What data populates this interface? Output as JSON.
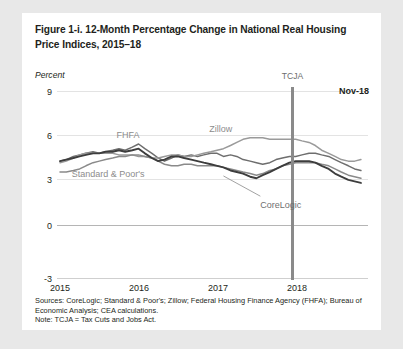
{
  "figure": {
    "title": "Figure 1-i. 12-Month Percentage Change in National Real Housing Price Indices, 2015–18",
    "y_axis_unit": "Percent",
    "nov_label": "Nov-18",
    "tcja_label": "TCJA",
    "sources": "Sources: CoreLogic; Standard & Poor's; Zillow; Federal Housing Finance Agency (FHFA); Bureau of Economic Analysis; CEA calculations.",
    "note": "Note: TCJA = Tax Cuts and Jobs Act."
  },
  "colors": {
    "corelogic": "#3d3d3d",
    "fhfa": "#6e6e6e",
    "zillow": "#9a9a9a",
    "standard_poors": "#8a8a8a",
    "tcja_marker": "#8a8a8a",
    "gridline": "#e3e3e3",
    "zeroline": "#b5b5b5",
    "card_background": "#ffffff",
    "page_background": "#e8e8e8",
    "text": "#231f20"
  },
  "chart_data": {
    "type": "line",
    "title": "Figure 1-i. 12-Month Percentage Change in National Real Housing Price Indices, 2015–18",
    "xlabel": "",
    "ylabel": "Percent",
    "ylim": [
      -3,
      9
    ],
    "yticks": [
      9,
      6,
      3,
      0,
      -3
    ],
    "ytick_labels": [
      "9",
      "6",
      "3",
      "0",
      "-3"
    ],
    "xlim": [
      2015.0,
      2018.92
    ],
    "xticks": [
      2015,
      2016,
      2017,
      2018
    ],
    "xtick_labels": [
      "2015",
      "2016",
      "2017",
      "2018"
    ],
    "grid": true,
    "legend": "inline-labels",
    "annotations": [
      {
        "name": "tcja",
        "text": "TCJA",
        "x": 2017.96,
        "type": "vertical-line"
      },
      {
        "name": "last-observation",
        "text": "Nov-18",
        "x": 2018.87,
        "y": 8.3,
        "type": "text"
      },
      {
        "name": "corelogic-leader",
        "text": "CoreLogic",
        "x": 2017.55,
        "y": 2.0,
        "type": "leader-line"
      }
    ],
    "series": [
      {
        "name": "FHFA",
        "color": "#6e6e6e",
        "label_x": 2015.72,
        "label_y": 6.1,
        "x": [
          2015.0,
          2015.08,
          2015.17,
          2015.25,
          2015.33,
          2015.42,
          2015.5,
          2015.58,
          2015.67,
          2015.75,
          2015.83,
          2015.92,
          2016.0,
          2016.08,
          2016.17,
          2016.25,
          2016.33,
          2016.42,
          2016.5,
          2016.58,
          2016.67,
          2016.75,
          2016.83,
          2016.92,
          2017.0,
          2017.08,
          2017.17,
          2017.25,
          2017.33,
          2017.42,
          2017.5,
          2017.58,
          2017.67,
          2017.75,
          2017.83,
          2017.92,
          2018.0,
          2018.08,
          2018.17,
          2018.25,
          2018.33,
          2018.42,
          2018.5,
          2018.58,
          2018.67,
          2018.75,
          2018.83
        ],
        "values": [
          4.5,
          4.6,
          4.8,
          4.9,
          5.0,
          5.1,
          5.0,
          5.1,
          5.2,
          5.3,
          5.2,
          5.4,
          5.6,
          5.3,
          5.0,
          4.7,
          4.5,
          4.7,
          4.9,
          4.8,
          4.9,
          4.8,
          4.9,
          5.0,
          5.0,
          4.8,
          4.9,
          4.8,
          4.6,
          4.5,
          4.4,
          4.3,
          4.4,
          4.6,
          4.7,
          4.8,
          4.8,
          4.9,
          5.0,
          5.0,
          4.9,
          4.8,
          4.6,
          4.4,
          4.2,
          4.0,
          3.9
        ]
      },
      {
        "name": "Zillow",
        "color": "#9a9a9a",
        "label_x": 2016.9,
        "label_y": 6.5,
        "x": [
          2015.0,
          2015.08,
          2015.17,
          2015.25,
          2015.33,
          2015.42,
          2015.5,
          2015.58,
          2015.67,
          2015.75,
          2015.83,
          2015.92,
          2016.0,
          2016.08,
          2016.17,
          2016.25,
          2016.33,
          2016.42,
          2016.5,
          2016.58,
          2016.67,
          2016.75,
          2016.83,
          2016.92,
          2017.0,
          2017.08,
          2017.17,
          2017.25,
          2017.33,
          2017.42,
          2017.5,
          2017.58,
          2017.67,
          2017.75,
          2017.83,
          2017.92,
          2018.0,
          2018.08,
          2018.17,
          2018.25,
          2018.33,
          2018.42,
          2018.5,
          2018.58,
          2018.67,
          2018.75,
          2018.83
        ],
        "values": [
          4.4,
          4.5,
          4.7,
          4.9,
          5.0,
          5.0,
          5.0,
          5.0,
          5.0,
          4.9,
          4.9,
          4.9,
          4.8,
          4.8,
          4.7,
          4.7,
          4.8,
          4.9,
          4.9,
          4.8,
          4.8,
          4.9,
          5.0,
          5.1,
          5.2,
          5.3,
          5.5,
          5.7,
          5.9,
          6.0,
          6.0,
          6.0,
          5.9,
          5.9,
          5.9,
          5.9,
          5.9,
          5.8,
          5.7,
          5.5,
          5.2,
          5.0,
          4.8,
          4.6,
          4.5,
          4.5,
          4.6
        ]
      },
      {
        "name": "Standard & Poor's",
        "color": "#8a8a8a",
        "label_x": 2015.15,
        "label_y": 3.6,
        "x": [
          2015.0,
          2015.08,
          2015.17,
          2015.25,
          2015.33,
          2015.42,
          2015.5,
          2015.58,
          2015.67,
          2015.75,
          2015.83,
          2015.92,
          2016.0,
          2016.08,
          2016.17,
          2016.25,
          2016.33,
          2016.42,
          2016.5,
          2016.58,
          2016.67,
          2016.75,
          2016.83,
          2016.92,
          2017.0,
          2017.08,
          2017.17,
          2017.25,
          2017.33,
          2017.42,
          2017.5,
          2017.58,
          2017.67,
          2017.75,
          2017.83,
          2017.92,
          2018.0,
          2018.08,
          2018.17,
          2018.25,
          2018.33,
          2018.42,
          2018.5,
          2018.58,
          2018.67,
          2018.75,
          2018.83
        ],
        "values": [
          3.8,
          3.8,
          3.9,
          4.0,
          4.2,
          4.4,
          4.5,
          4.6,
          4.7,
          4.8,
          4.8,
          4.9,
          4.9,
          4.8,
          4.7,
          4.5,
          4.3,
          4.2,
          4.2,
          4.3,
          4.3,
          4.2,
          4.2,
          4.2,
          4.2,
          4.1,
          4.0,
          3.9,
          3.8,
          3.7,
          3.6,
          3.7,
          3.9,
          4.0,
          4.2,
          4.3,
          4.4,
          4.4,
          4.4,
          4.4,
          4.3,
          4.2,
          4.0,
          3.8,
          3.6,
          3.5,
          3.4
        ]
      },
      {
        "name": "CoreLogic",
        "color": "#3d3d3d",
        "label_x": 2017.55,
        "label_y": 1.6,
        "x": [
          2015.0,
          2015.08,
          2015.17,
          2015.25,
          2015.33,
          2015.42,
          2015.5,
          2015.58,
          2015.67,
          2015.75,
          2015.83,
          2015.92,
          2016.0,
          2016.08,
          2016.17,
          2016.25,
          2016.33,
          2016.42,
          2016.5,
          2016.58,
          2016.67,
          2016.75,
          2016.83,
          2016.92,
          2017.0,
          2017.08,
          2017.17,
          2017.25,
          2017.33,
          2017.42,
          2017.5,
          2017.58,
          2017.67,
          2017.75,
          2017.83,
          2017.92,
          2018.0,
          2018.08,
          2018.17,
          2018.25,
          2018.33,
          2018.42,
          2018.5,
          2018.58,
          2018.67,
          2018.75,
          2018.83
        ],
        "values": [
          4.5,
          4.6,
          4.7,
          4.8,
          4.9,
          5.0,
          5.0,
          5.1,
          5.1,
          5.2,
          5.1,
          5.2,
          5.3,
          5.0,
          4.7,
          4.5,
          4.6,
          4.8,
          4.8,
          4.7,
          4.6,
          4.5,
          4.4,
          4.3,
          4.2,
          4.1,
          3.9,
          3.8,
          3.7,
          3.5,
          3.4,
          3.6,
          3.8,
          4.0,
          4.2,
          4.4,
          4.5,
          4.5,
          4.5,
          4.4,
          4.2,
          4.0,
          3.7,
          3.5,
          3.3,
          3.2,
          3.1
        ]
      }
    ]
  }
}
